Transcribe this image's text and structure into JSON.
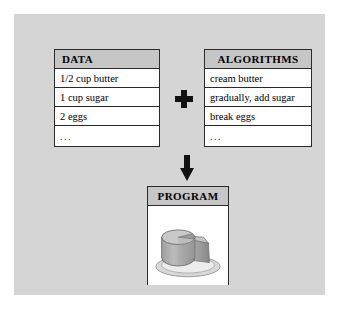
{
  "diagram": {
    "title_concept": "Program = Data + Algorithms",
    "panel_color": "#d5d5d5",
    "card_header_color": "#c6c6c6",
    "border_color": "#2b2b2b",
    "shadow_color": "#4a4a4a"
  },
  "cards": {
    "data": {
      "header": "DATA",
      "rows": [
        "1/2 cup butter",
        "1 cup sugar",
        "2 eggs",
        "..."
      ]
    },
    "algorithms": {
      "header": "ALGORITHMS",
      "rows": [
        "cream butter",
        "gradually, add sugar",
        "break eggs",
        "..."
      ]
    },
    "program": {
      "header": "PROGRAM",
      "illustration": "cake-on-plate-illustration"
    }
  },
  "connectors": {
    "plus": "plus-sign",
    "arrow": "down-arrow"
  }
}
